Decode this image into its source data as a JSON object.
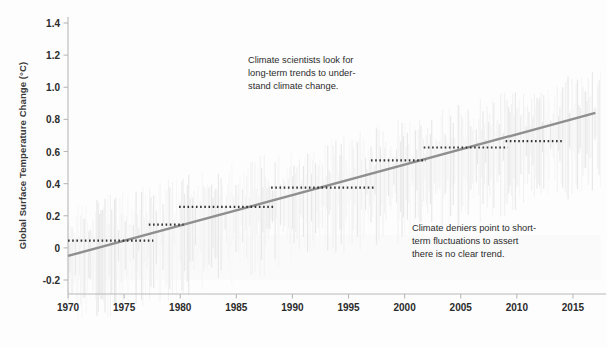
{
  "chart_data": {
    "type": "line",
    "title": "",
    "subtitle": "",
    "xlabel": "",
    "ylabel": "Global Surface Temperature Change (°C)",
    "xlim": [
      1969.2,
      2017.5
    ],
    "ylim": [
      -0.32,
      1.45
    ],
    "grid": false,
    "legend": "none",
    "x_ticks": [
      "1970",
      "1975",
      "1980",
      "1985",
      "1990",
      "1995",
      "2000",
      "2005",
      "2010",
      "2015"
    ],
    "x_tick_values": [
      1970,
      1975,
      1980,
      1985,
      1990,
      1995,
      2000,
      2005,
      2010,
      2015
    ],
    "y_ticks": [
      "1.4",
      "1.2",
      "1.0",
      "0.8",
      "0.6",
      "0.4",
      "0.2",
      "0",
      "-0.2"
    ],
    "y_tick_values": [
      1.4,
      1.2,
      1.0,
      0.8,
      0.6,
      0.4,
      0.2,
      0,
      -0.2
    ],
    "series": [
      {
        "name": "Long-term linear trend",
        "type": "line",
        "style": "solid",
        "color": "#8f8f8f",
        "x": [
          1970,
          2017
        ],
        "values": [
          -0.05,
          0.84
        ]
      },
      {
        "name": "Short-term flat segments (cherry-picked trends)",
        "type": "step-segments",
        "style": "dotted",
        "color": "#353535",
        "segments": [
          {
            "x0": 1970.0,
            "x1": 1977.6,
            "y": 0.045
          },
          {
            "x0": 1977.2,
            "x1": 1980.3,
            "y": 0.145
          },
          {
            "x0": 1979.9,
            "x1": 1988.3,
            "y": 0.255
          },
          {
            "x0": 1988.1,
            "x1": 1997.3,
            "y": 0.375
          },
          {
            "x0": 1997.0,
            "x1": 2001.9,
            "y": 0.545
          },
          {
            "x0": 2001.7,
            "x1": 2009.2,
            "y": 0.625
          },
          {
            "x0": 2009.0,
            "x1": 2014.0,
            "y": 0.665
          }
        ]
      },
      {
        "name": "Annual temperature anomaly (background noise)",
        "type": "noise-bars",
        "color": "#f0f0f0",
        "x_start": 1970,
        "x_end": 2017
      }
    ],
    "annotations": [
      {
        "id": "scientists-note",
        "text": "Climate scientists look for\nlong-term trends to under-\nstand climate change.",
        "x_px": 248,
        "y_px": 54
      },
      {
        "id": "deniers-note",
        "text": "Climate deniers point to short-\nterm fluctuations to assert\nthere is no clear trend.",
        "x_px": 412,
        "y_px": 222
      }
    ],
    "colors": {
      "trend_line": "#8f8f8f",
      "dotted_segments": "#353535",
      "axis": "#b9b9b9",
      "tick_text": "#2b2b2b",
      "annotation_text": "#2c2c2c",
      "background": "#fdfdfd",
      "noise": "#efefef"
    }
  }
}
